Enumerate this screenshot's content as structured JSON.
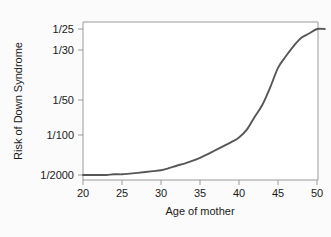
{
  "figure": {
    "background_color": "#fbfbfb",
    "plot_background_color": "#ffffff",
    "frame_color": "#9a9a9a"
  },
  "chart_data": {
    "type": "line",
    "title": "",
    "subtitle": "",
    "xlabel": "Age of mother",
    "ylabel": "Risk of Down Syndrome",
    "xlim": [
      20,
      51
    ],
    "xticks": [
      20,
      25,
      30,
      35,
      40,
      45,
      50
    ],
    "xticklabels": [
      "20",
      "25",
      "30",
      "35",
      "40",
      "45",
      "50"
    ],
    "yticklabels": [
      "1/25",
      "1/30",
      "1/50",
      "1/100",
      "1/2000"
    ],
    "ytickvalues": [
      25,
      30,
      50,
      100,
      2000
    ],
    "y_axis_note": "Risk expressed as 1-in-N; axis is nonlinear, ordered from 1/2000 (lowest risk, bottom) to 1/25 (highest risk, top)",
    "grid": false,
    "legend": null,
    "series": [
      {
        "name": "Risk of Down Syndrome by maternal age",
        "color": "#575757",
        "x": [
          20,
          21,
          22,
          23,
          24,
          25,
          26,
          27,
          28,
          29,
          30,
          31,
          32,
          33,
          34,
          35,
          36,
          37,
          38,
          39,
          40,
          41,
          42,
          43,
          44,
          45,
          46,
          47,
          48,
          49,
          50,
          51
        ],
        "y_labels": [
          "1/2000",
          "1/2000",
          "1/2000",
          "1/2000",
          "1/1900",
          "1/1900",
          "1/1800",
          "1/1700",
          "1/1600",
          "1/1500",
          "1/1400",
          "1/1200",
          "1/1000",
          "1/850",
          "1/700",
          "1/550",
          "1/420",
          "1/310",
          "1/230",
          "1/170",
          "1/120",
          "1/90",
          "1/70",
          "1/55",
          "1/44",
          "1/36",
          "1/32",
          "1/29",
          "1/27",
          "1/26",
          "1/25",
          "1/25"
        ]
      }
    ]
  }
}
